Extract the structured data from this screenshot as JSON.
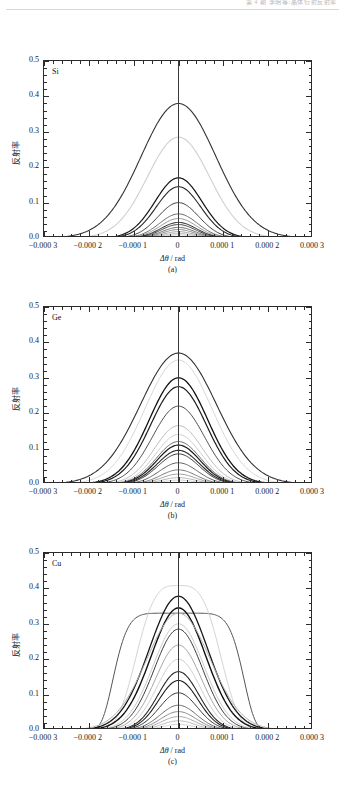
{
  "header": {
    "text": "第 4 期            李明等:晶体衍射反射率"
  },
  "figure": {
    "y_axis_label": "反射率",
    "x_axis_label": "Δθ / rad",
    "x_axis_label_symbol": "Δθ",
    "x_axis_label_unit": "/ rad",
    "y_ticks": [
      "0.0",
      "0.1",
      "0.2",
      "0.3",
      "0.4",
      "0.5"
    ],
    "x_ticks": [
      "−0.000 3",
      "−0.000 2",
      "−0.000 1",
      "0",
      "0.000 1",
      "0.000 2",
      "0.000 3"
    ]
  },
  "chart_data": [
    {
      "type": "line",
      "title": "Si",
      "panel_label": "(a)",
      "xlabel": "Δθ / rad",
      "ylabel": "反射率",
      "xlim": [
        -0.0003,
        0.0003
      ],
      "ylim": [
        0.0,
        0.5
      ],
      "xticks": [
        -0.0003,
        -0.0002,
        -0.0001,
        0,
        0.0001,
        0.0002,
        0.0003
      ],
      "yticks": [
        0.0,
        0.1,
        0.2,
        0.3,
        0.4,
        0.5
      ],
      "grid": false,
      "legend": "none",
      "series": [
        {
          "name": "curve-1",
          "peak": 0.38,
          "width": 0.000118,
          "shade": "#333333",
          "weight": 1.1,
          "shape": "gauss"
        },
        {
          "name": "curve-2",
          "peak": 0.285,
          "width": 9.8e-05,
          "shade": "#d0d0d0",
          "weight": 1.1,
          "shape": "gauss"
        },
        {
          "name": "curve-3",
          "peak": 0.17,
          "width": 7.4e-05,
          "shade": "#151515",
          "weight": 1.2,
          "shape": "gauss"
        },
        {
          "name": "curve-4",
          "peak": 0.145,
          "width": 7e-05,
          "shade": "#262626",
          "weight": 1.1,
          "shape": "gauss"
        },
        {
          "name": "curve-5",
          "peak": 0.1,
          "width": 6.4e-05,
          "shade": "#3d3d3d",
          "weight": 1.0,
          "shape": "gauss"
        },
        {
          "name": "curve-6",
          "peak": 0.068,
          "width": 6e-05,
          "shade": "#5a5a5a",
          "weight": 0.9,
          "shape": "gauss"
        },
        {
          "name": "curve-7",
          "peak": 0.055,
          "width": 5.8e-05,
          "shade": "#8c8c8c",
          "weight": 0.9,
          "shape": "gauss"
        },
        {
          "name": "curve-8",
          "peak": 0.044,
          "width": 5.6e-05,
          "shade": "#1b1b1b",
          "weight": 1.0,
          "shape": "gauss"
        },
        {
          "name": "curve-9",
          "peak": 0.038,
          "width": 5.4e-05,
          "shade": "#2e2e2e",
          "weight": 0.9,
          "shape": "gauss"
        },
        {
          "name": "curve-10",
          "peak": 0.03,
          "width": 5.2e-05,
          "shade": "#4a4a4a",
          "weight": 0.8,
          "shape": "gauss"
        },
        {
          "name": "curve-11",
          "peak": 0.024,
          "width": 5e-05,
          "shade": "#6e6e6e",
          "weight": 0.8,
          "shape": "gauss"
        },
        {
          "name": "curve-12",
          "peak": 0.018,
          "width": 4.8e-05,
          "shade": "#8f8f8f",
          "weight": 0.8,
          "shape": "gauss"
        },
        {
          "name": "curve-13",
          "peak": 0.013,
          "width": 4.6e-05,
          "shade": "#a8a8a8",
          "weight": 0.7,
          "shape": "gauss"
        },
        {
          "name": "curve-14",
          "peak": 0.009,
          "width": 4.4e-05,
          "shade": "#bdbdbd",
          "weight": 0.7,
          "shape": "gauss"
        }
      ]
    },
    {
      "type": "line",
      "title": "Ge",
      "panel_label": "(b)",
      "xlabel": "Δθ / rad",
      "ylabel": "反射率",
      "xlim": [
        -0.0003,
        0.0003
      ],
      "ylim": [
        0.0,
        0.5
      ],
      "xticks": [
        -0.0003,
        -0.0002,
        -0.0001,
        0,
        0.0001,
        0.0002,
        0.0003
      ],
      "yticks": [
        0.0,
        0.1,
        0.2,
        0.3,
        0.4,
        0.5
      ],
      "grid": false,
      "legend": "none",
      "series": [
        {
          "name": "curve-1",
          "peak": 0.37,
          "width": 0.00012,
          "shade": "#303030",
          "weight": 1.1,
          "shape": "gauss"
        },
        {
          "name": "curve-2",
          "peak": 0.35,
          "width": 0.000106,
          "shade": "#d6d6d6",
          "weight": 1.0,
          "shape": "gauss"
        },
        {
          "name": "curve-3",
          "peak": 0.3,
          "width": 9.2e-05,
          "shade": "#121212",
          "weight": 1.3,
          "shape": "gauss"
        },
        {
          "name": "curve-4",
          "peak": 0.275,
          "width": 8.8e-05,
          "shade": "#1c1c1c",
          "weight": 1.2,
          "shape": "gauss"
        },
        {
          "name": "curve-5",
          "peak": 0.22,
          "width": 8.2e-05,
          "shade": "#4a4a4a",
          "weight": 1.0,
          "shape": "gauss"
        },
        {
          "name": "curve-6",
          "peak": 0.165,
          "width": 7.6e-05,
          "shade": "#b4b4b4",
          "weight": 0.9,
          "shape": "gauss"
        },
        {
          "name": "curve-7",
          "peak": 0.14,
          "width": 7.2e-05,
          "shade": "#c8c8c8",
          "weight": 0.9,
          "shape": "gauss"
        },
        {
          "name": "curve-8",
          "peak": 0.12,
          "width": 7e-05,
          "shade": "#5e5e5e",
          "weight": 0.9,
          "shape": "gauss"
        },
        {
          "name": "curve-9",
          "peak": 0.11,
          "width": 6.8e-05,
          "shade": "#1a1a1a",
          "weight": 1.2,
          "shape": "gauss"
        },
        {
          "name": "curve-10",
          "peak": 0.095,
          "width": 6.6e-05,
          "shade": "#282828",
          "weight": 1.1,
          "shape": "gauss"
        },
        {
          "name": "curve-11",
          "peak": 0.085,
          "width": 6.4e-05,
          "shade": "#3a3a3a",
          "weight": 1.0,
          "shape": "gauss"
        },
        {
          "name": "curve-12",
          "peak": 0.06,
          "width": 6e-05,
          "shade": "#4f4f4f",
          "weight": 0.9,
          "shape": "gauss"
        },
        {
          "name": "curve-13",
          "peak": 0.04,
          "width": 5.6e-05,
          "shade": "#6b6b6b",
          "weight": 0.9,
          "shape": "gauss"
        },
        {
          "name": "curve-14",
          "peak": 0.028,
          "width": 5.4e-05,
          "shade": "#8a8a8a",
          "weight": 0.8,
          "shape": "gauss"
        },
        {
          "name": "curve-15",
          "peak": 0.018,
          "width": 5.2e-05,
          "shade": "#a5a5a5",
          "weight": 0.8,
          "shape": "gauss"
        },
        {
          "name": "curve-16",
          "peak": 0.011,
          "width": 5e-05,
          "shade": "#bebebe",
          "weight": 0.7,
          "shape": "gauss"
        }
      ]
    },
    {
      "type": "line",
      "title": "Cu",
      "panel_label": "(c)",
      "xlabel": "Δθ / rad",
      "ylabel": "反射率",
      "xlim": [
        -0.0003,
        0.0003
      ],
      "ylim": [
        0.0,
        0.5
      ],
      "xticks": [
        -0.0003,
        -0.0002,
        -0.0001,
        0,
        0.0001,
        0.0002,
        0.0003
      ],
      "yticks": [
        0.0,
        0.1,
        0.2,
        0.3,
        0.4,
        0.5
      ],
      "grid": false,
      "legend": "none",
      "series": [
        {
          "name": "curve-plateau",
          "peak": 0.33,
          "width": 0.00015,
          "shade": "#555555",
          "weight": 1.0,
          "shape": "flat"
        },
        {
          "name": "curve-1",
          "peak": 0.408,
          "width": 0.000106,
          "shade": "#d4d4d4",
          "weight": 1.0,
          "shape": "flattop"
        },
        {
          "name": "curve-2",
          "peak": 0.378,
          "width": 9.2e-05,
          "shade": "#171717",
          "weight": 1.3,
          "shape": "gauss"
        },
        {
          "name": "curve-3",
          "peak": 0.345,
          "width": 8.6e-05,
          "shade": "#101010",
          "weight": 1.4,
          "shape": "gauss"
        },
        {
          "name": "curve-4",
          "peak": 0.33,
          "width": 0.0001,
          "shade": "#b0b0b0",
          "weight": 1.0,
          "shape": "gauss"
        },
        {
          "name": "curve-5",
          "peak": 0.3,
          "width": 8e-05,
          "shade": "#c4c4c4",
          "weight": 0.9,
          "shape": "gauss"
        },
        {
          "name": "curve-6",
          "peak": 0.285,
          "width": 7.6e-05,
          "shade": "#3b3b3b",
          "weight": 1.0,
          "shape": "gauss"
        },
        {
          "name": "curve-7",
          "peak": 0.24,
          "width": 7.2e-05,
          "shade": "#9a9a9a",
          "weight": 0.9,
          "shape": "gauss"
        },
        {
          "name": "curve-8",
          "peak": 0.2,
          "width": 6.8e-05,
          "shade": "#c9c9c9",
          "weight": 0.9,
          "shape": "gauss"
        },
        {
          "name": "curve-9",
          "peak": 0.165,
          "width": 6.4e-05,
          "shade": "#2a2a2a",
          "weight": 1.1,
          "shape": "gauss"
        },
        {
          "name": "curve-10",
          "peak": 0.14,
          "width": 6.2e-05,
          "shade": "#1d1d1d",
          "weight": 1.1,
          "shape": "gauss"
        },
        {
          "name": "curve-11",
          "peak": 0.105,
          "width": 6e-05,
          "shade": "#333333",
          "weight": 1.0,
          "shape": "gauss"
        },
        {
          "name": "curve-12",
          "peak": 0.07,
          "width": 5.8e-05,
          "shade": "#5c5c5c",
          "weight": 0.9,
          "shape": "gauss"
        },
        {
          "name": "curve-13",
          "peak": 0.052,
          "width": 5.6e-05,
          "shade": "#7d7d7d",
          "weight": 0.9,
          "shape": "gauss"
        },
        {
          "name": "curve-14",
          "peak": 0.038,
          "width": 5.4e-05,
          "shade": "#949494",
          "weight": 0.8,
          "shape": "gauss"
        },
        {
          "name": "curve-15",
          "peak": 0.026,
          "width": 5.2e-05,
          "shade": "#ababab",
          "weight": 0.8,
          "shape": "gauss"
        },
        {
          "name": "curve-16",
          "peak": 0.016,
          "width": 5e-05,
          "shade": "#c2c2c2",
          "weight": 0.7,
          "shape": "gauss"
        }
      ]
    }
  ]
}
